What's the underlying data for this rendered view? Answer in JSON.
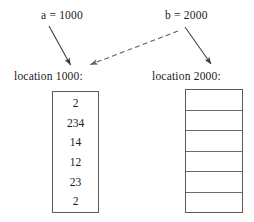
{
  "diagram": {
    "pointers": [
      {
        "id": "a",
        "label": "a = 1000",
        "name": "a",
        "value": "1000"
      },
      {
        "id": "b",
        "label": "b = 2000",
        "name": "b",
        "value": "2000"
      }
    ],
    "blocks": [
      {
        "id": "left",
        "caption": "location 1000:",
        "address": "1000",
        "cells": [
          "2",
          "234",
          "14",
          "12",
          "23",
          "2"
        ],
        "cell_count": 6,
        "has_internal_rules": false
      },
      {
        "id": "right",
        "caption": "location 2000:",
        "address": "2000",
        "cells": [
          "",
          "",
          "",
          "",
          "",
          ""
        ],
        "cell_count": 6,
        "has_internal_rules": true
      }
    ],
    "arrows": [
      {
        "id": "a-to-left",
        "style": "solid",
        "from": "a = 1000",
        "to": "location 1000:"
      },
      {
        "id": "b-to-left",
        "style": "dashed",
        "from": "b = 2000",
        "to": "location 1000:"
      },
      {
        "id": "b-to-right",
        "style": "solid",
        "from": "b = 2000",
        "to": "location 2000:"
      }
    ],
    "colors": {
      "ink": "#1a1a1a",
      "stroke": "#5a5a5a",
      "rule": "#6b6b6b",
      "background": "#ffffff"
    }
  }
}
